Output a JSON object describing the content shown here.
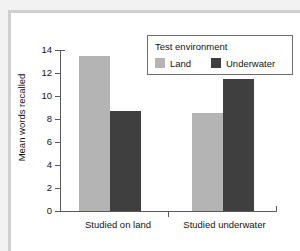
{
  "chart_data": {
    "type": "bar",
    "title": "",
    "subtitle": "",
    "xlabel": "",
    "ylabel": "Mean words recalled",
    "categories": [
      "Studied on land",
      "Studied underwater"
    ],
    "series": [
      {
        "name": "Land",
        "color": "#b4b4b4",
        "values": [
          13.5,
          8.5
        ]
      },
      {
        "name": "Underwater",
        "color": "#3f3f3f",
        "values": [
          8.7,
          11.5
        ]
      }
    ],
    "ylim": [
      0,
      14
    ],
    "ytick_labels": [
      "0",
      "2",
      "4",
      "6",
      "8",
      "10",
      "12",
      "14"
    ],
    "ytick_values": [
      0,
      2,
      4,
      6,
      8,
      10,
      12,
      14
    ],
    "grid": false,
    "legend": {
      "title": "Test environment",
      "position": "top-right",
      "entries": [
        "Land",
        "Underwater"
      ]
    }
  }
}
